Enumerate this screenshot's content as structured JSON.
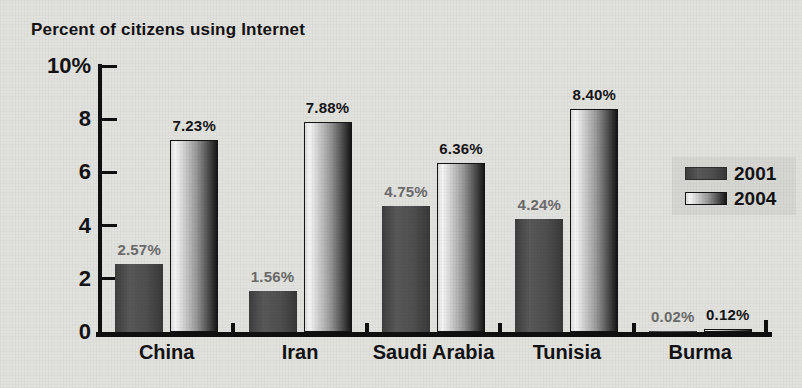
{
  "chart_data": {
    "type": "bar",
    "title": "Percent of citizens using Internet",
    "categories": [
      "China",
      "Iran",
      "Saudi Arabia",
      "Tunisia",
      "Burma"
    ],
    "series": [
      {
        "name": "2001",
        "values": [
          2.57,
          1.56,
          4.75,
          4.24,
          0.02
        ],
        "value_labels": [
          "2.57%",
          "1.56%",
          "4.75%",
          "4.24%",
          "0.02%"
        ],
        "label_color": "#6b6b6b",
        "bar_gradient": [
          "#3e3e3e",
          "#585858",
          "#4f4f4f",
          "#383838"
        ],
        "border_color": "#2e2e2e"
      },
      {
        "name": "2004",
        "values": [
          7.23,
          7.88,
          6.36,
          8.4,
          0.12
        ],
        "value_labels": [
          "7.23%",
          "7.88%",
          "6.36%",
          "8.40%",
          "0.12%"
        ],
        "label_color": "#141414",
        "bar_gradient": [
          "#dcdcdc",
          "#f5f5f5",
          "#c8c8c8",
          "#989898",
          "#5f5f5f",
          "#161616"
        ],
        "border_color": "#141414"
      }
    ],
    "y_ticks": [
      {
        "label": "10%",
        "value": 10
      },
      {
        "label": "8",
        "value": 8
      },
      {
        "label": "6",
        "value": 6
      },
      {
        "label": "4",
        "value": 4
      },
      {
        "label": "2",
        "value": 2
      },
      {
        "label": "0",
        "value": 0
      }
    ],
    "ylim": [
      0,
      10
    ],
    "grid": false,
    "legend_position": "middle-right"
  },
  "colors": {
    "background": "#e1e1de",
    "axis": "#0f0f0f",
    "legend_box": "#d6d6d3"
  }
}
